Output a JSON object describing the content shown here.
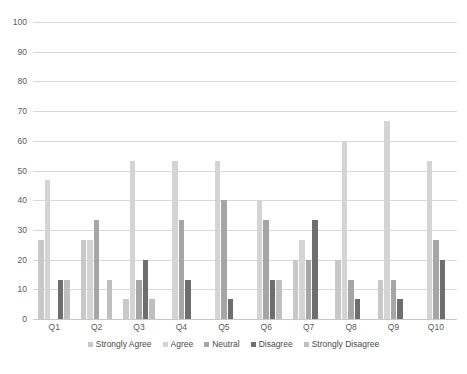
{
  "chart_data": {
    "type": "bar",
    "title": "",
    "xlabel": "",
    "ylabel": "",
    "ylim": [
      0,
      100
    ],
    "ytick_step": 10,
    "yticks": [
      100,
      90,
      80,
      70,
      60,
      50,
      40,
      30,
      20,
      10,
      0
    ],
    "grid": "horizontal",
    "legend_position": "bottom",
    "categories": [
      "Q1",
      "Q2",
      "Q3",
      "Q4",
      "Q5",
      "Q6",
      "Q7",
      "Q8",
      "Q9",
      "Q10"
    ],
    "series": [
      {
        "name": "Strongly Agree",
        "color": "#c8c8c8",
        "values": [
          26.7,
          26.7,
          6.7,
          0,
          0,
          0,
          20,
          20,
          13.3,
          0
        ]
      },
      {
        "name": "Agree",
        "color": "#d4d4d4",
        "values": [
          46.7,
          26.7,
          53.3,
          53.3,
          53.3,
          40,
          26.7,
          60,
          66.7,
          53.3
        ]
      },
      {
        "name": "Neutral",
        "color": "#a6a6a6",
        "values": [
          0,
          33.3,
          13.3,
          33.3,
          40,
          33.3,
          20,
          13.3,
          13.3,
          26.7
        ]
      },
      {
        "name": "Disagree",
        "color": "#6e6e6e",
        "values": [
          13.3,
          0,
          20,
          13.3,
          6.7,
          13.3,
          33.3,
          6.7,
          6.7,
          20
        ]
      },
      {
        "name": "Strongly Disagree",
        "color": "#bfbfbf",
        "values": [
          13.3,
          13.3,
          6.7,
          0,
          0,
          13.3,
          0,
          0,
          0,
          0
        ]
      }
    ]
  },
  "caption": ""
}
